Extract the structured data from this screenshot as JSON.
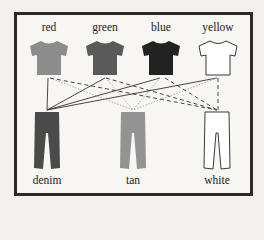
{
  "shirts": [
    {
      "label": "red",
      "fill": "#8c8c8c",
      "x": 49
    },
    {
      "label": "green",
      "fill": "#5a5a5a",
      "x": 105
    },
    {
      "label": "blue",
      "fill": "#222222",
      "x": 161
    },
    {
      "label": "yellow",
      "fill": "#ffffff",
      "x": 218
    }
  ],
  "pants": [
    {
      "label": "denim",
      "fill": "#4a4a4a",
      "x": 47
    },
    {
      "label": "tan",
      "fill": "#939393",
      "x": 133
    },
    {
      "label": "white",
      "fill": "#ffffff",
      "x": 217
    }
  ],
  "connections": {
    "to_denim": "solid",
    "to_tan": "dotted",
    "to_white": "dashed"
  }
}
